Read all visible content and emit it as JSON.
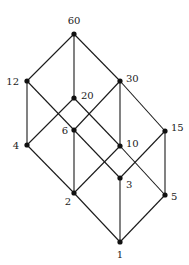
{
  "diagram": {
    "nodes": [
      {
        "id": "60",
        "label": "60",
        "x": 74,
        "y": 34,
        "lx": 74,
        "ly": 24,
        "anchor": "middle"
      },
      {
        "id": "12",
        "label": "12",
        "x": 27,
        "y": 81,
        "lx": 19,
        "ly": 85,
        "anchor": "end"
      },
      {
        "id": "30",
        "label": "30",
        "x": 120,
        "y": 81,
        "lx": 126,
        "ly": 82,
        "anchor": "start"
      },
      {
        "id": "20",
        "label": "20",
        "x": 74,
        "y": 98,
        "lx": 81,
        "ly": 99,
        "anchor": "start"
      },
      {
        "id": "6",
        "label": "6",
        "x": 74,
        "y": 130,
        "lx": 68,
        "ly": 134,
        "anchor": "end"
      },
      {
        "id": "15",
        "label": "15",
        "x": 165,
        "y": 131,
        "lx": 171,
        "ly": 131,
        "anchor": "start"
      },
      {
        "id": "4",
        "label": "4",
        "x": 27,
        "y": 145,
        "lx": 19,
        "ly": 149,
        "anchor": "end"
      },
      {
        "id": "10",
        "label": "10",
        "x": 120,
        "y": 146,
        "lx": 126,
        "ly": 147,
        "anchor": "start"
      },
      {
        "id": "3",
        "label": "3",
        "x": 120,
        "y": 178,
        "lx": 126,
        "ly": 188,
        "anchor": "start"
      },
      {
        "id": "2",
        "label": "2",
        "x": 74,
        "y": 193,
        "lx": 68,
        "ly": 205,
        "anchor": "middle"
      },
      {
        "id": "5",
        "label": "5",
        "x": 165,
        "y": 195,
        "lx": 171,
        "ly": 200,
        "anchor": "start"
      },
      {
        "id": "1",
        "label": "1",
        "x": 120,
        "y": 242,
        "lx": 120,
        "ly": 258,
        "anchor": "middle"
      }
    ],
    "edges": [
      [
        "60",
        "12"
      ],
      [
        "60",
        "20"
      ],
      [
        "60",
        "30"
      ],
      [
        "12",
        "4"
      ],
      [
        "12",
        "6"
      ],
      [
        "30",
        "6"
      ],
      [
        "30",
        "10"
      ],
      [
        "30",
        "15"
      ],
      [
        "20",
        "4"
      ],
      [
        "20",
        "10"
      ],
      [
        "6",
        "2"
      ],
      [
        "6",
        "3"
      ],
      [
        "10",
        "2"
      ],
      [
        "10",
        "5"
      ],
      [
        "15",
        "3"
      ],
      [
        "15",
        "5"
      ],
      [
        "4",
        "2"
      ],
      [
        "2",
        "1"
      ],
      [
        "3",
        "1"
      ],
      [
        "5",
        "1"
      ]
    ],
    "colors": {
      "edge": "#1a1a1a",
      "node": "#111111",
      "label": "#222222",
      "background": "#ffffff"
    }
  }
}
